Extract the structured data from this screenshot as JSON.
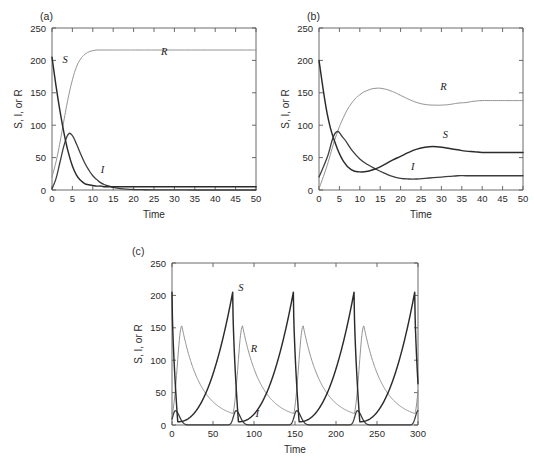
{
  "figure": {
    "panels": [
      {
        "id": "a",
        "letter": "(a)",
        "xlabel": "Time",
        "ylabel": "S, I, or R",
        "xlim": [
          0,
          50
        ],
        "ylim": [
          0,
          250
        ],
        "xticks": [
          0,
          5,
          10,
          15,
          20,
          25,
          30,
          35,
          40,
          45,
          50
        ],
        "yticks": [
          0,
          50,
          100,
          150,
          200,
          250
        ],
        "curve_labels": [
          {
            "text": "S",
            "x": 3.2,
            "y": 196
          },
          {
            "text": "I",
            "x": 12.4,
            "y": 26
          },
          {
            "text": "R",
            "x": 27.5,
            "y": 208
          }
        ]
      },
      {
        "id": "b",
        "letter": "(b)",
        "xlabel": "Time",
        "ylabel": "S, I, or R",
        "xlim": [
          0,
          50
        ],
        "ylim": [
          0,
          250
        ],
        "xticks": [
          0,
          5,
          10,
          15,
          20,
          25,
          30,
          35,
          40,
          45,
          50
        ],
        "yticks": [
          0,
          50,
          100,
          150,
          200,
          250
        ],
        "curve_labels": [
          {
            "text": "R",
            "x": 30.5,
            "y": 155
          },
          {
            "text": "S",
            "x": 31.0,
            "y": 80
          },
          {
            "text": "I",
            "x": 23.0,
            "y": 31
          }
        ]
      },
      {
        "id": "c",
        "letter": "(c)",
        "xlabel": "Time",
        "ylabel": "S, I, or R",
        "xlim": [
          0,
          300
        ],
        "ylim": [
          0,
          250
        ],
        "xticks": [
          0,
          50,
          100,
          150,
          200,
          250,
          300
        ],
        "yticks": [
          0,
          50,
          100,
          150,
          200,
          250
        ],
        "curve_labels": [
          {
            "text": "S",
            "x": 84,
            "y": 207
          },
          {
            "text": "R",
            "x": 100,
            "y": 113
          },
          {
            "text": "I",
            "x": 104,
            "y": 12
          }
        ]
      }
    ]
  },
  "style": {
    "color_S": "#2b2b2b",
    "color_I": "#3d3d3d",
    "color_R": "#8c8c8c",
    "width_S": 1.45,
    "width_I": 1.3,
    "width_R": 0.95,
    "axis_color": "#5a5a5a",
    "background": "#ffffff"
  },
  "chart_data": [
    {
      "type": "line",
      "panel": "a",
      "title": "(a)",
      "xlabel": "Time",
      "ylabel": "S, I, or R",
      "xlim": [
        0,
        50
      ],
      "ylim": [
        0,
        250
      ],
      "xticks": [
        0,
        5,
        10,
        15,
        20,
        25,
        30,
        35,
        40,
        45,
        50
      ],
      "yticks": [
        0,
        50,
        100,
        150,
        200,
        250
      ],
      "grid": false,
      "legend": "inline-curve-labels",
      "x": [
        0,
        1,
        2,
        3,
        4,
        5,
        6,
        7,
        8,
        9,
        10,
        11,
        12,
        13,
        14,
        15,
        16,
        17,
        18,
        19,
        20,
        22,
        25,
        30,
        35,
        40,
        45,
        50
      ],
      "series": [
        {
          "name": "S",
          "values": [
            205,
            160,
            120,
            86,
            58,
            37,
            23,
            15,
            10,
            8,
            7,
            6,
            6,
            5,
            5,
            5,
            5,
            5,
            5,
            5,
            5,
            5,
            5,
            5,
            5,
            5,
            5,
            5
          ]
        },
        {
          "name": "I",
          "values": [
            2,
            18,
            44,
            70,
            86,
            84,
            71,
            56,
            42,
            31,
            22,
            16,
            11,
            8,
            6,
            4,
            3,
            2,
            1.5,
            1,
            0.8,
            0.5,
            0.2,
            0.1,
            0,
            0,
            0,
            0
          ]
        },
        {
          "name": "R",
          "values": [
            20,
            44,
            75,
            110,
            143,
            170,
            190,
            202,
            209,
            213,
            215,
            216,
            216,
            216,
            216,
            216,
            216,
            216,
            216,
            216,
            216,
            216,
            216,
            216,
            216,
            216,
            216,
            216
          ]
        }
      ]
    },
    {
      "type": "line",
      "panel": "b",
      "title": "(b)",
      "xlabel": "Time",
      "ylabel": "S, I, or R",
      "xlim": [
        0,
        50
      ],
      "ylim": [
        0,
        250
      ],
      "xticks": [
        0,
        5,
        10,
        15,
        20,
        25,
        30,
        35,
        40,
        45,
        50
      ],
      "yticks": [
        0,
        50,
        100,
        150,
        200,
        250
      ],
      "grid": false,
      "legend": "inline-curve-labels",
      "x": [
        0,
        2,
        4,
        6,
        8,
        10,
        12,
        14,
        16,
        18,
        20,
        22,
        24,
        26,
        28,
        30,
        32,
        34,
        36,
        38,
        40,
        42,
        44,
        46,
        48,
        50
      ],
      "series": [
        {
          "name": "S",
          "values": [
            200,
            118,
            72,
            44,
            31,
            28,
            29,
            33,
            39,
            46,
            52,
            58,
            63,
            66,
            67,
            66,
            64,
            62,
            60,
            59,
            58,
            58,
            58,
            58,
            58,
            58
          ]
        },
        {
          "name": "I",
          "values": [
            20,
            50,
            88,
            80,
            62,
            48,
            39,
            32,
            26,
            21,
            18,
            17,
            17,
            18,
            19,
            20,
            21,
            22,
            22,
            22,
            22,
            22,
            22,
            22,
            22,
            22
          ]
        },
        {
          "name": "R",
          "values": [
            2,
            38,
            80,
            112,
            134,
            147,
            154,
            157,
            156,
            152,
            146,
            140,
            135,
            132,
            131,
            131,
            132,
            134,
            135,
            137,
            138,
            138,
            138,
            138,
            138,
            138
          ]
        }
      ]
    },
    {
      "type": "line",
      "panel": "c",
      "title": "(c)",
      "xlabel": "Time",
      "ylabel": "S, I, or R",
      "xlim": [
        0,
        300
      ],
      "ylim": [
        0,
        250
      ],
      "xticks": [
        0,
        50,
        100,
        150,
        200,
        250,
        300
      ],
      "yticks": [
        0,
        50,
        100,
        150,
        200,
        250
      ],
      "grid": false,
      "legend": "inline-curve-labels",
      "period": 74,
      "notes": "Sustained undamped oscillations; S sawtooth peaks ~205 at t=74,148,223,298; R peaks ~153 shortly after each S crash; I spikes narrow and low (<25).",
      "series": [
        {
          "name": "S",
          "peak": 205,
          "trough": 5,
          "peak_times": [
            74,
            148,
            223,
            298
          ]
        },
        {
          "name": "I",
          "peak": 22,
          "trough": 0.2,
          "peak_times": [
            4,
            78,
            152,
            227
          ]
        },
        {
          "name": "R",
          "peak": 153,
          "trough": 8,
          "peak_times": [
            12,
            86,
            160,
            235
          ]
        }
      ]
    }
  ]
}
